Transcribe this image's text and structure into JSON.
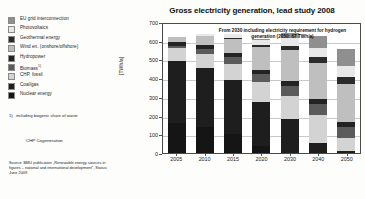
{
  "chart_data": {
    "type": "bar",
    "stacked": true,
    "title": "Gross electricity generation, lead study 2008",
    "xlabel": "",
    "ylabel": "[TWh/a]",
    "ylim": [
      0,
      700
    ],
    "ytick_step": 100,
    "yticks": [
      0,
      100,
      200,
      300,
      400,
      500,
      600,
      700
    ],
    "grid": true,
    "legend_position": "left-outside",
    "categories": [
      "2005",
      "2010",
      "2015",
      "2020",
      "2030",
      "2040",
      "2050"
    ],
    "annotation": "From 2030 including electricity requirement for hydrogen generation (2050: 67 TWh/a)",
    "series": [
      {
        "name": "Nuclear energy",
        "color": "#151515",
        "values": [
          163,
          140,
          100,
          40,
          0,
          0,
          0
        ]
      },
      {
        "name": "Coal/gas",
        "color": "#1e1e1e",
        "values": [
          331,
          314,
          292,
          232,
          182,
          55,
          10
        ]
      },
      {
        "name": "CHP, fossil",
        "color": "#d3d3d3",
        "values": [
          67,
          75,
          86,
          105,
          122,
          150,
          72
        ]
      },
      {
        "name": "Biomass",
        "color": "#5b5b5b",
        "values": [
          12,
          28,
          34,
          43,
          52,
          55,
          55
        ]
      },
      {
        "name": "Hydropower",
        "color": "#232323",
        "values": [
          21,
          22,
          24,
          25,
          27,
          28,
          30
        ]
      },
      {
        "name": "Wind en. (onshore/offshore)",
        "color": "#bfbfbf",
        "values": [
          27,
          48,
          75,
          120,
          168,
          195,
          200
        ]
      },
      {
        "name": "Geothermal energy",
        "color": "#2b2b2b",
        "values": [
          0,
          1,
          4,
          10,
          22,
          32,
          42
        ]
      },
      {
        "name": "Photovoltaics",
        "color": "#e8e8e8",
        "values": [
          1,
          8,
          20,
          28,
          40,
          48,
          55
        ]
      },
      {
        "name": "EU grid interconnection",
        "color": "#8f8f8f",
        "values": [
          0,
          0,
          0,
          5,
          30,
          63,
          90
        ]
      }
    ]
  },
  "legend": {
    "items": [
      {
        "label": "EU grid interconnection",
        "color": "#8f8f8f",
        "sup": ""
      },
      {
        "label": "Photovoltaics",
        "color": "#e8e8e8",
        "sup": ""
      },
      {
        "label": "Geothermal energy",
        "color": "#2b2b2b",
        "sup": ""
      },
      {
        "label": "Wind en. (onshore/offshore)",
        "color": "#bfbfbf",
        "sup": ""
      },
      {
        "label": "Hydropower",
        "color": "#232323",
        "sup": ""
      },
      {
        "label": "Biomass",
        "color": "#5b5b5b",
        "sup": "1)"
      },
      {
        "label": "CHP, fossil",
        "color": "#d3d3d3",
        "sup": ""
      },
      {
        "label": "Coal/gas",
        "color": "#1e1e1e",
        "sup": ""
      },
      {
        "label": "Nuclear energy",
        "color": "#151515",
        "sup": ""
      }
    ]
  },
  "footnote": {
    "mark": "1)",
    "text": "including biogenic share of waste"
  },
  "abbreviation": {
    "text": "CHP Cogeneration"
  },
  "source": {
    "text": "Source: BMU publication „Renewable energy sources in figures – national and international development“, Status: June 2009"
  }
}
